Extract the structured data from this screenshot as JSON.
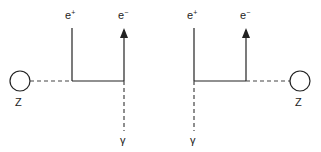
{
  "diagrams": [
    {
      "id": "left",
      "z_label": "Z",
      "positron_label": "e",
      "positron_sup": "+",
      "electron_label": "e",
      "electron_sup": "−",
      "photon_label": "γ"
    },
    {
      "id": "right",
      "z_label": "Z",
      "positron_label": "e",
      "positron_sup": "+",
      "electron_label": "e",
      "electron_sup": "−",
      "photon_label": "γ"
    }
  ],
  "colors": {
    "line": "#222222",
    "dash": "#444444"
  }
}
